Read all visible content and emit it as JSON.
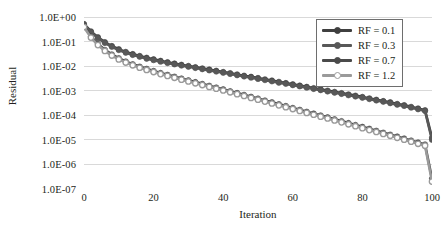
{
  "chart_data": {
    "type": "line",
    "title": "",
    "xlabel": "Iteration",
    "ylabel": "Residual",
    "xlim": [
      0,
      100
    ],
    "ylim": [
      1e-07,
      1.0
    ],
    "yscale": "log",
    "grid": "horizontal",
    "legend_position": "top-right",
    "x_ticks": [
      0,
      20,
      40,
      60,
      80,
      100
    ],
    "x_tick_labels": [
      "0",
      "20",
      "40",
      "60",
      "80",
      "100"
    ],
    "y_ticks": [
      1,
      0.1,
      0.01,
      0.001,
      0.0001,
      1e-05,
      1e-06,
      1e-07
    ],
    "y_tick_labels": [
      "1.0E+00",
      "1.0E-01",
      "1.0E-02",
      "1.0E-03",
      "1.0E-04",
      "1.0E-05",
      "1.0E-06",
      "1.0E-07"
    ],
    "colors": {
      "series_1": "#3f3f3f",
      "series_2": "#585858",
      "series_3": "#4a4a4a",
      "series_4": "#9a9a9a",
      "gridline": "#d9d9d9",
      "legend_border": "#6e6e6e",
      "text": "#231f20"
    },
    "series": [
      {
        "name": "RF = 0.1",
        "color": "#3f3f3f",
        "marker": "circle-filled",
        "x": [
          0,
          2,
          4,
          6,
          8,
          10,
          12,
          14,
          16,
          18,
          20,
          22,
          24,
          26,
          28,
          30,
          32,
          34,
          36,
          38,
          40,
          42,
          44,
          46,
          48,
          50,
          52,
          54,
          56,
          58,
          60,
          62,
          64,
          66,
          68,
          70,
          72,
          74,
          76,
          78,
          80,
          82,
          84,
          86,
          88,
          90,
          92,
          94,
          96,
          98,
          100
        ],
        "y": [
          0.52,
          0.26,
          0.15,
          0.095,
          0.066,
          0.049,
          0.038,
          0.031,
          0.026,
          0.022,
          0.019,
          0.0165,
          0.0145,
          0.0128,
          0.0114,
          0.0102,
          0.0091,
          0.0081,
          0.0073,
          0.0065,
          0.0058,
          0.0052,
          0.0046,
          0.0041,
          0.0037,
          0.0033,
          0.0029,
          0.0026,
          0.0023,
          0.00205,
          0.00182,
          0.00162,
          0.00144,
          0.00128,
          0.00114,
          0.00101,
          0.0009,
          0.0008,
          0.00071,
          0.00063,
          0.00056,
          0.00049,
          0.00043,
          0.00038,
          0.00034,
          0.00029,
          0.00026,
          0.00022,
          0.00019,
          0.00016,
          1.2e-05
        ]
      },
      {
        "name": "RF = 0.3",
        "color": "#585858",
        "marker": "circle-filled",
        "x": [
          0,
          2,
          4,
          6,
          8,
          10,
          12,
          14,
          16,
          18,
          20,
          22,
          24,
          26,
          28,
          30,
          32,
          34,
          36,
          38,
          40,
          42,
          44,
          46,
          48,
          50,
          52,
          54,
          56,
          58,
          60,
          62,
          64,
          66,
          68,
          70,
          72,
          74,
          76,
          78,
          80,
          82,
          84,
          86,
          88,
          90,
          92,
          94,
          96,
          98,
          100
        ],
        "y": [
          0.48,
          0.24,
          0.138,
          0.088,
          0.061,
          0.045,
          0.035,
          0.0285,
          0.024,
          0.02,
          0.0175,
          0.0152,
          0.0133,
          0.0118,
          0.0105,
          0.0094,
          0.0084,
          0.0075,
          0.0067,
          0.006,
          0.00535,
          0.0048,
          0.00425,
          0.0038,
          0.0034,
          0.003,
          0.0027,
          0.0024,
          0.00212,
          0.0019,
          0.00168,
          0.0015,
          0.00133,
          0.00118,
          0.00105,
          0.00093,
          0.00083,
          0.00074,
          0.00065,
          0.00058,
          0.000515,
          0.000455,
          0.0004,
          0.000355,
          0.00031,
          0.00027,
          0.00024,
          0.000205,
          0.000175,
          0.00015,
          1e-05
        ]
      },
      {
        "name": "RF = 0.7",
        "color": "#4a4a4a",
        "marker": "circle-filled",
        "x": [
          0,
          2,
          4,
          6,
          8,
          10,
          12,
          14,
          16,
          18,
          20,
          22,
          24,
          26,
          28,
          30,
          32,
          34,
          36,
          38,
          40,
          42,
          44,
          46,
          48,
          50,
          52,
          54,
          56,
          58,
          60,
          62,
          64,
          66,
          68,
          70,
          72,
          74,
          76,
          78,
          80,
          82,
          84,
          86,
          88,
          90,
          92,
          94,
          96,
          98,
          100
        ],
        "y": [
          0.42,
          0.16,
          0.08,
          0.046,
          0.03,
          0.021,
          0.0155,
          0.012,
          0.0096,
          0.0078,
          0.0064,
          0.0053,
          0.00445,
          0.00375,
          0.00315,
          0.00265,
          0.00225,
          0.0019,
          0.0016,
          0.00135,
          0.00114,
          0.00096,
          0.00081,
          0.00068,
          0.00057,
          0.00048,
          0.0004,
          0.00034,
          0.000285,
          0.00024,
          0.0002,
          0.000168,
          0.00014,
          0.000118,
          9.9e-05,
          8.3e-05,
          6.9e-05,
          5.8e-05,
          4.85e-05,
          4.05e-05,
          3.4e-05,
          2.85e-05,
          2.35e-05,
          1.97e-05,
          1.64e-05,
          1.37e-05,
          1.14e-05,
          9.4e-06,
          7.8e-06,
          6.5e-06,
          2.6e-07
        ]
      },
      {
        "name": "RF = 1.2",
        "color": "#9a9a9a",
        "marker": "circle-open",
        "x": [
          0,
          2,
          4,
          6,
          8,
          10,
          12,
          14,
          16,
          18,
          20,
          22,
          24,
          26,
          28,
          30,
          32,
          34,
          36,
          38,
          40,
          42,
          44,
          46,
          48,
          50,
          52,
          54,
          56,
          58,
          60,
          62,
          64,
          66,
          68,
          70,
          72,
          74,
          76,
          78,
          80,
          82,
          84,
          86,
          88,
          90,
          92,
          94,
          96,
          98,
          100
        ],
        "y": [
          0.39,
          0.145,
          0.072,
          0.0415,
          0.027,
          0.0188,
          0.014,
          0.0108,
          0.0086,
          0.007,
          0.00575,
          0.00475,
          0.004,
          0.00335,
          0.00282,
          0.00238,
          0.002,
          0.0017,
          0.00143,
          0.00121,
          0.00102,
          0.00086,
          0.000725,
          0.00061,
          0.00051,
          0.00043,
          0.00036,
          0.000302,
          0.000254,
          0.000213,
          0.000179,
          0.00015,
          0.000125,
          0.000105,
          8.8e-05,
          7.4e-05,
          6.15e-05,
          5.15e-05,
          4.3e-05,
          3.6e-05,
          3e-05,
          2.5e-05,
          2.1e-05,
          1.75e-05,
          1.46e-05,
          1.21e-05,
          1.01e-05,
          8.4e-06,
          6.9e-06,
          5.8e-06,
          2e-07
        ]
      }
    ]
  }
}
